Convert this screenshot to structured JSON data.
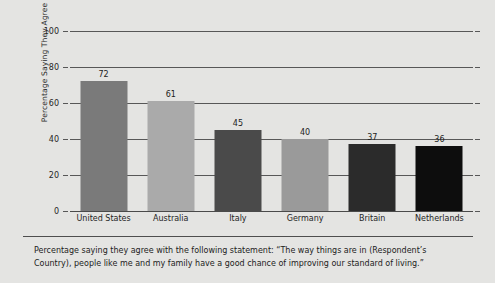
{
  "chart_data": {
    "type": "bar",
    "title": "",
    "xlabel": "",
    "ylabel": "Percentage Saying They Agree",
    "ylim": [
      0,
      100
    ],
    "yticks": [
      0,
      20,
      40,
      60,
      80,
      100
    ],
    "grid": true,
    "legend": "none",
    "categories": [
      "United States",
      "Australia",
      "Italy",
      "Germany",
      "Britain",
      "Netherlands"
    ],
    "values": [
      72,
      61,
      45,
      40,
      37,
      36
    ],
    "bar_colors": [
      "#7a7a7a",
      "#aaaaaa",
      "#4a4a4a",
      "#9a9a9a",
      "#2b2b2b",
      "#0d0d0d"
    ],
    "caption": "Percentage saying they agree with the following statement: “The way things are in (Respondent’s Country), people like me and my family have a good chance of improving our standard of living.”"
  },
  "axis": {
    "y_tick_labels": [
      "0",
      "20",
      "40",
      "60",
      "80",
      "100"
    ]
  },
  "colors": {
    "panel_background": "#e4e4e2",
    "gridline": "#575757",
    "axis_text": "#262626"
  }
}
